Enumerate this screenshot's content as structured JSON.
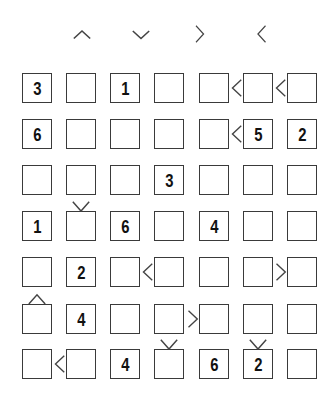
{
  "legend": {
    "symbols": [
      {
        "name": "up-caret",
        "glyph": "^",
        "x": 82
      },
      {
        "name": "down-caret",
        "glyph": "v",
        "x": 141
      },
      {
        "name": "greater-than",
        "glyph": ">",
        "x": 199
      },
      {
        "name": "less-than",
        "glyph": "<",
        "x": 261
      }
    ]
  },
  "grid": {
    "size": 7,
    "col_x": [
      22,
      66,
      110,
      154,
      199,
      243,
      287
    ],
    "row_y": [
      73,
      119,
      165,
      211,
      257,
      304,
      349
    ],
    "cell_size": 30,
    "values": [
      [
        "3",
        "",
        "1",
        "",
        "",
        "",
        ""
      ],
      [
        "6",
        "",
        "",
        "",
        "",
        "5",
        "2"
      ],
      [
        "",
        "",
        "",
        "3",
        "",
        "",
        ""
      ],
      [
        "1",
        "",
        "6",
        "",
        "4",
        "",
        ""
      ],
      [
        "",
        "2",
        "",
        "",
        "",
        "",
        ""
      ],
      [
        "",
        "4",
        "",
        "",
        "",
        "",
        ""
      ],
      [
        "",
        "",
        "4",
        "",
        "6",
        "2",
        ""
      ]
    ]
  },
  "constraints": {
    "horizontal": [
      {
        "row": 0,
        "col": 4,
        "sign": "<"
      },
      {
        "row": 0,
        "col": 5,
        "sign": "<"
      },
      {
        "row": 1,
        "col": 4,
        "sign": "<"
      },
      {
        "row": 4,
        "col": 2,
        "sign": "<"
      },
      {
        "row": 4,
        "col": 5,
        "sign": ">"
      },
      {
        "row": 5,
        "col": 3,
        "sign": ">"
      },
      {
        "row": 6,
        "col": 0,
        "sign": "<"
      }
    ],
    "vertical": [
      {
        "row": 2,
        "col": 1,
        "sign": "v"
      },
      {
        "row": 4,
        "col": 0,
        "sign": "^"
      },
      {
        "row": 5,
        "col": 3,
        "sign": "v"
      },
      {
        "row": 5,
        "col": 5,
        "sign": "v"
      }
    ]
  },
  "colors": {
    "border": "#3a3a3a",
    "digit": "#111111",
    "sign": "#444444",
    "background": "#ffffff"
  }
}
